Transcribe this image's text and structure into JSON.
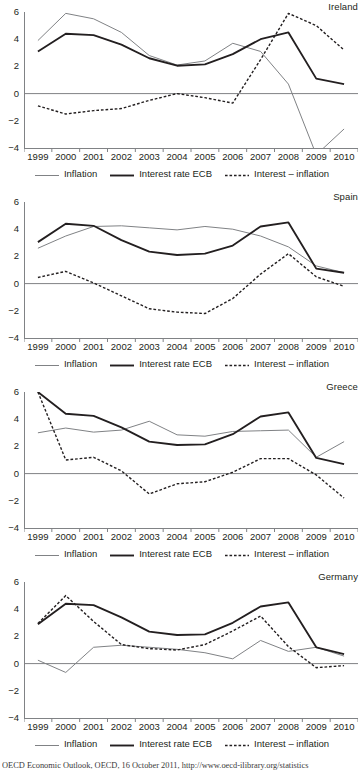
{
  "figure": {
    "source_note": "OECD Economic Outlook, OECD, 16 October 2011, http://www.oecd-ilibrary.org/statistics"
  },
  "legend": {
    "items": [
      {
        "label": "Inflation",
        "style": "solid-thin",
        "color": "#808285"
      },
      {
        "label": "Interest rate ECB",
        "style": "solid-thick",
        "color": "#231f20"
      },
      {
        "label": "Interest – inflation",
        "style": "dotted",
        "color": "#231f20"
      }
    ]
  },
  "axis": {
    "y_ticks": [
      6,
      4,
      2,
      0,
      -2,
      -4
    ],
    "y_tick_labels": [
      "6",
      "4",
      "2",
      "0",
      "−2",
      "−4"
    ],
    "ylim": [
      -4,
      6
    ],
    "x_ticks": [
      1999,
      2000,
      2001,
      2002,
      2003,
      2004,
      2005,
      2006,
      2007,
      2008,
      2009,
      2010
    ],
    "x_tick_labels": [
      "1999",
      "2000",
      "2001",
      "2002",
      "2003",
      "2004",
      "2005",
      "2006",
      "2007",
      "2008",
      "2009",
      "2010"
    ],
    "xlim": [
      1999,
      2011
    ]
  },
  "chart_data": [
    {
      "type": "line",
      "title": "Ireland",
      "xlabel": "",
      "ylabel": "",
      "ylim": [
        -4,
        6
      ],
      "grid": false,
      "legend_position": "bottom",
      "x": [
        1999,
        2000,
        2001,
        2002,
        2003,
        2004,
        2005,
        2006,
        2007,
        2008,
        2009,
        2010
      ],
      "series": [
        {
          "name": "Inflation",
          "values": [
            3.9,
            5.9,
            5.5,
            4.5,
            2.8,
            2.1,
            2.4,
            3.7,
            3.1,
            0.7,
            -4.5,
            -2.6
          ]
        },
        {
          "name": "Interest rate ECB",
          "values": [
            3.1,
            4.4,
            4.3,
            3.6,
            2.6,
            2.05,
            2.15,
            2.9,
            4.0,
            4.5,
            1.1,
            0.7
          ]
        },
        {
          "name": "Interest – inflation",
          "values": [
            -0.9,
            -1.5,
            -1.25,
            -1.1,
            -0.5,
            0.0,
            -0.3,
            -0.7,
            2.5,
            5.9,
            5.0,
            3.2
          ]
        }
      ]
    },
    {
      "type": "line",
      "title": "Spain",
      "xlabel": "",
      "ylabel": "",
      "ylim": [
        -4,
        6
      ],
      "grid": false,
      "legend_position": "bottom",
      "x": [
        1999,
        2000,
        2001,
        2002,
        2003,
        2004,
        2005,
        2006,
        2007,
        2008,
        2009,
        2010
      ],
      "series": [
        {
          "name": "Inflation",
          "values": [
            2.6,
            3.5,
            4.2,
            4.25,
            4.1,
            3.95,
            4.2,
            4.0,
            3.5,
            2.7,
            1.3,
            0.8
          ]
        },
        {
          "name": "Interest rate ECB",
          "values": [
            3.05,
            4.4,
            4.25,
            3.2,
            2.35,
            2.1,
            2.2,
            2.8,
            4.2,
            4.5,
            1.1,
            0.8
          ]
        },
        {
          "name": "Interest – inflation",
          "values": [
            0.45,
            0.9,
            0.05,
            -0.9,
            -1.85,
            -2.1,
            -2.2,
            -1.1,
            0.7,
            2.2,
            0.5,
            -0.2
          ]
        }
      ]
    },
    {
      "type": "line",
      "title": "Greece",
      "xlabel": "",
      "ylabel": "",
      "ylim": [
        -4,
        6
      ],
      "grid": false,
      "legend_position": "bottom",
      "x": [
        1999,
        2000,
        2001,
        2002,
        2003,
        2004,
        2005,
        2006,
        2007,
        2008,
        2009,
        2010
      ],
      "series": [
        {
          "name": "Inflation",
          "values": [
            3.0,
            3.35,
            3.05,
            3.2,
            3.85,
            2.85,
            2.75,
            3.1,
            3.15,
            3.2,
            1.2,
            2.35
          ]
        },
        {
          "name": "Interest rate ECB",
          "values": [
            6.0,
            4.4,
            4.25,
            3.4,
            2.35,
            2.1,
            2.15,
            2.9,
            4.2,
            4.5,
            1.15,
            0.7
          ]
        },
        {
          "name": "Interest – inflation",
          "values": [
            6.0,
            1.0,
            1.2,
            0.2,
            -1.5,
            -0.75,
            -0.6,
            0.1,
            1.1,
            1.1,
            -0.1,
            -1.8
          ]
        }
      ]
    },
    {
      "type": "line",
      "title": "Germany",
      "xlabel": "",
      "ylabel": "",
      "ylim": [
        -4,
        6
      ],
      "grid": false,
      "legend_position": "bottom",
      "x": [
        1999,
        2000,
        2001,
        2002,
        2003,
        2004,
        2005,
        2006,
        2007,
        2008,
        2009,
        2010
      ],
      "series": [
        {
          "name": "Inflation",
          "values": [
            0.25,
            -0.65,
            1.2,
            1.35,
            1.2,
            1.05,
            0.8,
            0.35,
            1.7,
            0.9,
            1.2,
            0.55
          ]
        },
        {
          "name": "Interest rate ECB",
          "values": [
            2.9,
            4.4,
            4.3,
            3.4,
            2.35,
            2.1,
            2.15,
            3.0,
            4.2,
            4.5,
            1.2,
            0.7
          ]
        },
        {
          "name": "Interest – inflation",
          "values": [
            2.95,
            5.0,
            3.1,
            1.4,
            1.1,
            1.0,
            1.4,
            2.4,
            3.5,
            1.25,
            -0.3,
            -0.15
          ]
        }
      ]
    }
  ]
}
